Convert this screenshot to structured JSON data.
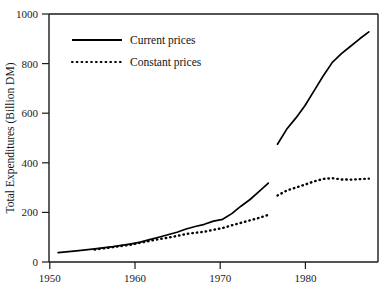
{
  "chart_data": {
    "type": "line",
    "title": "",
    "subtitle": "",
    "xlabel": "",
    "ylabel": "Total Expenditures (Billion DM)",
    "xlim": [
      1950,
      1986
    ],
    "ylim": [
      0,
      1000
    ],
    "xticks": [
      1950,
      1960,
      1970,
      1980
    ],
    "xtick_labels": [
      "1950",
      "1960",
      "1970",
      "1980"
    ],
    "yticks": [
      0,
      200,
      400,
      600,
      800,
      1000
    ],
    "ytick_labels": [
      "0",
      "200",
      "400",
      "600",
      "800",
      "1000"
    ],
    "grid": false,
    "legend_position": "upper left",
    "note": "Both series break between 1974 and 1975 (territorial/definition change); each series is drawn as two separate segments.",
    "series": [
      {
        "name": "Current prices",
        "style": "solid",
        "color": "#000000",
        "segments": [
          {
            "label": "1951-1974",
            "x": [
              1951,
              1953,
              1955,
              1957,
              1959,
              1960,
              1961,
              1962,
              1963,
              1964,
              1965,
              1966,
              1967,
              1968,
              1969,
              1970,
              1971,
              1972,
              1973,
              1974
            ],
            "y": [
              38,
              45,
              53,
              62,
              73,
              80,
              90,
              100,
              110,
              120,
              133,
              143,
              152,
              165,
              172,
              195,
              225,
              252,
              285,
              318
            ]
          },
          {
            "label": "1975-1985",
            "x": [
              1975,
              1976,
              1977,
              1978,
              1979,
              1980,
              1981,
              1982,
              1983,
              1984,
              1985
            ],
            "y": [
              475,
              535,
              580,
              630,
              690,
              750,
              805,
              840,
              870,
              900,
              928
            ]
          }
        ]
      },
      {
        "name": "Constant prices",
        "style": "dotted",
        "color": "#000000",
        "segments": [
          {
            "label": "1951-1974",
            "x": [
              1955,
              1957,
              1959,
              1960,
              1961,
              1962,
              1963,
              1964,
              1965,
              1966,
              1967,
              1968,
              1969,
              1970,
              1971,
              1972,
              1973,
              1974
            ],
            "y": [
              50,
              60,
              70,
              78,
              85,
              92,
              98,
              105,
              113,
              118,
              122,
              130,
              137,
              148,
              158,
              168,
              178,
              190
            ]
          },
          {
            "label": "1975-1985",
            "x": [
              1975,
              1976,
              1977,
              1978,
              1979,
              1980,
              1981,
              1982,
              1983,
              1984,
              1985
            ],
            "y": [
              268,
              288,
              300,
              312,
              325,
              335,
              338,
              333,
              332,
              334,
              336
            ]
          }
        ]
      }
    ]
  },
  "legend": {
    "entries": [
      {
        "label": "Current prices",
        "style": "solid"
      },
      {
        "label": "Constant prices",
        "style": "dotted"
      }
    ]
  },
  "axes": {
    "y_title": "Total Expenditures (Billion DM)"
  }
}
